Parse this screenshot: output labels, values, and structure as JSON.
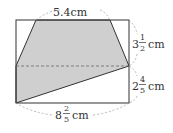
{
  "diagram": {
    "type": "geometry-figure",
    "colors": {
      "shade": "#cfcfcf",
      "stroke": "#333333",
      "dash": "#888888",
      "background": "#ffffff"
    },
    "labels": {
      "top": {
        "whole": "",
        "text": "5.4cm"
      },
      "right_upper": {
        "whole": "3",
        "num": "1",
        "den": "2",
        "unit": "cm"
      },
      "right_lower": {
        "whole": "2",
        "num": "4",
        "den": "5",
        "unit": "cm"
      },
      "bottom": {
        "whole": "8",
        "num": "2",
        "den": "5",
        "unit": "cm"
      }
    },
    "measurements": {
      "top_segment": "5.4cm",
      "right_upper_height": "3 1/2 cm",
      "right_lower_height": "2 4/5 cm",
      "bottom_width": "8 2/5 cm"
    }
  }
}
